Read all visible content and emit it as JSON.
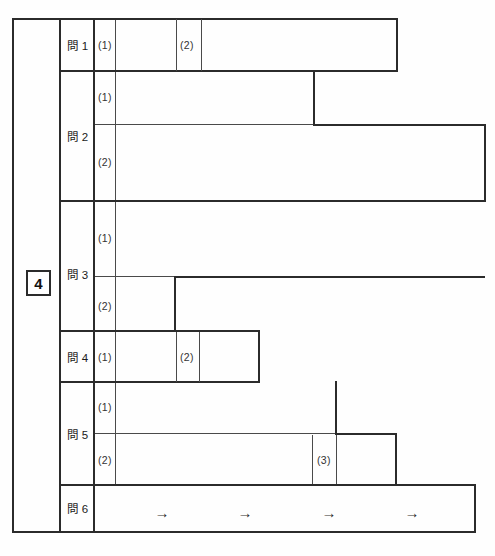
{
  "sheet": {
    "title": "answer-sheet-grid",
    "question_number": "4",
    "line_color": "#2b2b2b",
    "thin_line_color": "#555555",
    "background": "#ffffff"
  },
  "rows": [
    {
      "id": "mon1",
      "label": "問 1",
      "subs": [
        {
          "label": "(1)"
        },
        {
          "label": "(2)"
        }
      ]
    },
    {
      "id": "mon2",
      "label": "問 2",
      "subs": [
        {
          "label": "(1)"
        },
        {
          "label": "(2)"
        }
      ]
    },
    {
      "id": "mon3",
      "label": "問 3",
      "subs": [
        {
          "label": "(1)"
        },
        {
          "label": "(2)"
        }
      ]
    },
    {
      "id": "mon4",
      "label": "問 4",
      "subs": [
        {
          "label": "(1)"
        },
        {
          "label": "(2)"
        }
      ]
    },
    {
      "id": "mon5",
      "label": "問 5",
      "subs": [
        {
          "label": "(1)"
        },
        {
          "label": "(2)"
        },
        {
          "label": "(3)"
        }
      ]
    },
    {
      "id": "mon6",
      "label": "問 6",
      "subs": []
    }
  ],
  "mon6": {
    "arrows": [
      "→",
      "→",
      "→",
      "→"
    ]
  }
}
